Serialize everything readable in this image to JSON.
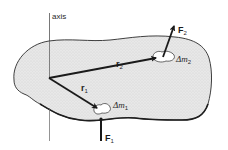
{
  "diagram": {
    "labels": {
      "axis": "axis",
      "r1": "r",
      "r1_sub": "1",
      "r2": "r",
      "r2_sub": "2",
      "dm1": "Δm",
      "dm1_sub": "1",
      "dm2": "Δm",
      "dm2_sub": "2",
      "F1": "F",
      "F1_sub": "1",
      "F2": "F",
      "F2_sub": "2"
    },
    "colors": {
      "body_fill": "#e6e6e6",
      "outline": "#2b2b2b",
      "vector": "#1a1a1a",
      "axis_line": "#555555",
      "background": "#ffffff"
    },
    "nodes": [
      {
        "id": "origin",
        "x": 49,
        "y": 78
      },
      {
        "id": "dm1",
        "x": 100,
        "y": 110
      },
      {
        "id": "dm2",
        "x": 160,
        "y": 58
      }
    ],
    "edges": [
      {
        "from": "origin",
        "to": "dm1",
        "label": "r1",
        "type": "position-vector"
      },
      {
        "from": "origin",
        "to": "dm2",
        "label": "r2",
        "type": "position-vector"
      },
      {
        "from": "dm1",
        "to": "down",
        "label": "F1",
        "type": "force"
      },
      {
        "from": "dm2",
        "to": "up-right",
        "label": "F2",
        "type": "force"
      }
    ]
  }
}
